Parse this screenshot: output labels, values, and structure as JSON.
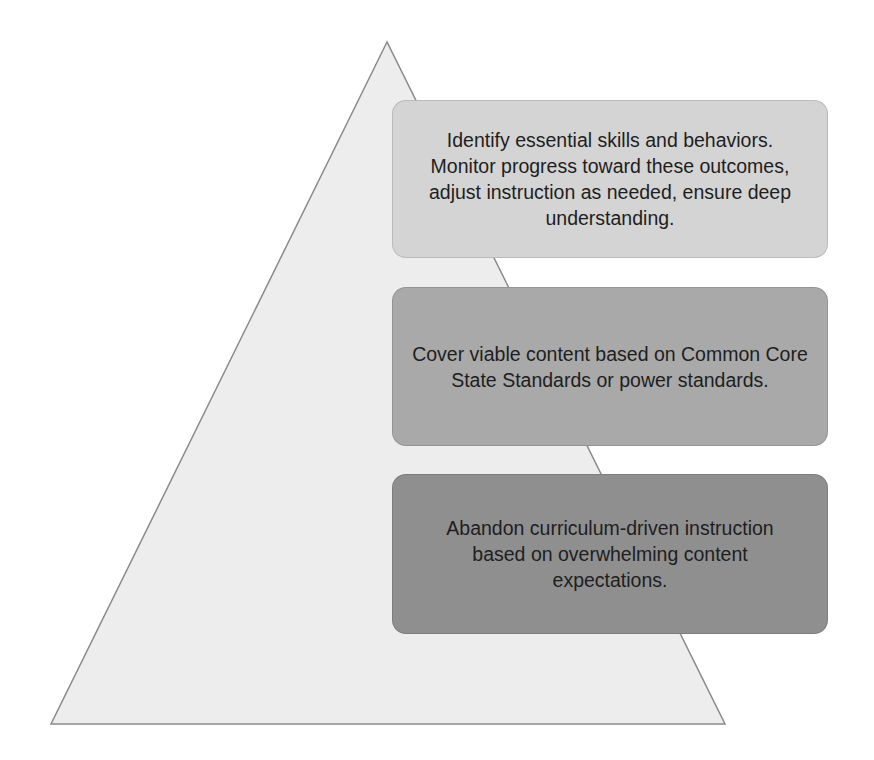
{
  "diagram": {
    "type": "pyramid",
    "pyramid": {
      "apex": [
        387,
        42
      ],
      "base_left": [
        51,
        724
      ],
      "base_right": [
        725,
        724
      ],
      "fill": "#ededed",
      "stroke": "#8a8a8a"
    },
    "levels": [
      {
        "id": "top",
        "text": "Identify essential skills and behaviors. Monitor progress toward these outcomes, adjust instruction as needed, ensure deep understanding.",
        "fill": "#d4d4d4",
        "top": 100,
        "height": 158
      },
      {
        "id": "middle",
        "text": "Cover viable content based on Common Core State Standards or power standards.",
        "fill": "#a9a9a9",
        "top": 287,
        "height": 159
      },
      {
        "id": "bottom",
        "text": "Abandon curriculum-driven instruction based on overwhelming content expectations.",
        "fill": "#8f8f8f",
        "top": 474,
        "height": 160
      }
    ]
  }
}
